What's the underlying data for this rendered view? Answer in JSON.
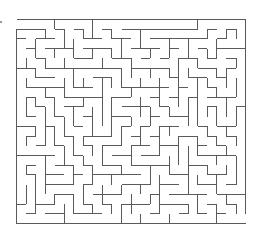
{
  "maze": {
    "title": "Maze puzzle",
    "cols": 24,
    "rows": 21,
    "origin_x": 16,
    "origin_y": 19,
    "width": 229,
    "height": 204,
    "wall_color": "#5a5a5a",
    "background": "#ffffff",
    "entrance": {
      "side": "top-left"
    },
    "exit": {
      "side": "bottom-right"
    },
    "seed": 20240607
  }
}
